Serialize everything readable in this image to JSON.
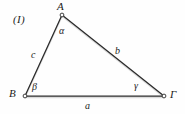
{
  "figure": {
    "number_label": "(I)",
    "type": "geometry-diagram",
    "background_color": "#fefefe",
    "stroke_color": "#2b2b2b",
    "text_color": "#1b1b1b",
    "width": 185,
    "height": 114
  },
  "vertices": [
    {
      "key": "A",
      "label": "A",
      "x": 62,
      "y": 15
    },
    {
      "key": "B",
      "label": "B",
      "x": 25,
      "y": 96
    },
    {
      "key": "G",
      "label": "Γ",
      "x": 164,
      "y": 96
    }
  ],
  "angles": [
    {
      "key": "alpha",
      "label": "α",
      "at_vertex": "A"
    },
    {
      "key": "beta",
      "label": "β",
      "at_vertex": "B"
    },
    {
      "key": "gamma",
      "label": "γ",
      "at_vertex": "Γ"
    }
  ],
  "sides": [
    {
      "key": "a",
      "label": "a",
      "from": "B",
      "to": "Γ"
    },
    {
      "key": "b",
      "label": "b",
      "from": "A",
      "to": "Γ"
    },
    {
      "key": "c",
      "label": "c",
      "from": "B",
      "to": "A"
    }
  ]
}
